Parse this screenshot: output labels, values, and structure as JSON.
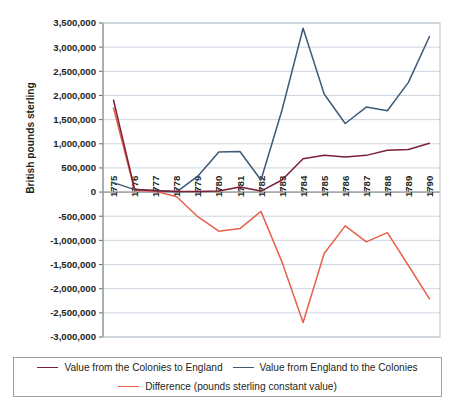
{
  "chart_data": {
    "type": "line",
    "title": "",
    "xlabel": "",
    "ylabel": "British pounds sterling",
    "x": [
      1775,
      1776,
      1777,
      1778,
      1779,
      1780,
      1781,
      1782,
      1783,
      1784,
      1785,
      1786,
      1787,
      1788,
      1789,
      1790
    ],
    "xtick_labels": [
      "1775",
      "1776",
      "1777",
      "1778",
      "1779",
      "1780",
      "1781",
      "1782",
      "1783",
      "1784",
      "1785",
      "1786",
      "1787",
      "1788",
      "1789",
      "1790"
    ],
    "ytick_labels": [
      "3,500,000",
      "3,000,000",
      "2,500,000",
      "2,000,000",
      "1,500,000",
      "1,000,000",
      "500,000",
      "0",
      "-500,000",
      "-1,000,000",
      "-1,500,000",
      "-2,000,000",
      "-2,500,000",
      "-3,000,000"
    ],
    "ytick_values": [
      3500000,
      3000000,
      2500000,
      2000000,
      1500000,
      1000000,
      500000,
      0,
      -500000,
      -1000000,
      -1500000,
      -2000000,
      -2500000,
      -3000000
    ],
    "ylim": [
      -3000000,
      3500000
    ],
    "grid": true,
    "legend_position": "bottom",
    "series": [
      {
        "name": "Value from the Colonies to England",
        "color": "#7b1f35",
        "values": [
          1900000,
          60000,
          30000,
          10000,
          10000,
          20000,
          105000,
          20000,
          250000,
          690000,
          760000,
          725000,
          760000,
          865000,
          880000,
          1010000
        ]
      },
      {
        "name": "Value from England to the Colonies",
        "color": "#3c5a78",
        "values": [
          195000,
          50000,
          35000,
          5000,
          330000,
          830000,
          840000,
          250000,
          1700000,
          3390000,
          2030000,
          1420000,
          1760000,
          1685000,
          2270000,
          3220000
        ]
      },
      {
        "name": "Difference (pounds sterling constant value)",
        "color": "#e8604c",
        "values": [
          1740000,
          35000,
          15000,
          -95000,
          -510000,
          -810000,
          -755000,
          -400000,
          -1450000,
          -2700000,
          -1270000,
          -700000,
          -1030000,
          -840000,
          -1520000,
          -2210000
        ]
      }
    ]
  },
  "legend": {
    "entries": [
      {
        "label": "Value from the Colonies to England"
      },
      {
        "label": "Value from England to the Colonies"
      },
      {
        "label": "Difference (pounds sterling constant value)"
      }
    ]
  }
}
